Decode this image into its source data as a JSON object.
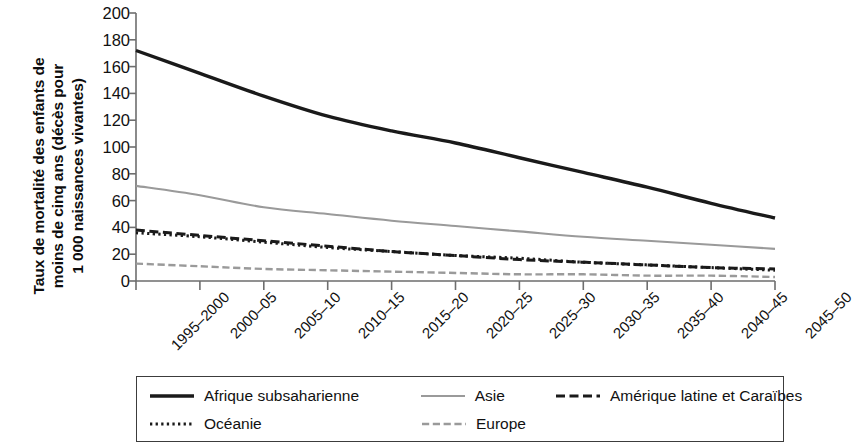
{
  "chart_data": {
    "type": "line",
    "title": "",
    "subtitle": "",
    "xlabel": "",
    "ylabel": "Taux de mortalité des enfants de\nmoins de cinq ans (décès pour\n1 000 naissances vivantes)",
    "ylim": [
      0,
      200
    ],
    "ytick_step": 20,
    "yticks": [
      200,
      180,
      160,
      140,
      120,
      100,
      80,
      60,
      40,
      20,
      0
    ],
    "grid": false,
    "legend_position": "bottom",
    "categories": [
      "1995–2000",
      "2000–05",
      "2005–10",
      "2010–15",
      "2015–20",
      "2020–25",
      "2025–30",
      "2030–35",
      "2035–40",
      "2040–45",
      "2045–50"
    ],
    "series": [
      {
        "name": "Afrique subsaharienne",
        "style": "solid",
        "color": "#1a1a1a",
        "width": 3.4,
        "values": [
          172,
          155,
          138,
          123,
          112,
          103,
          92,
          81,
          70,
          58,
          47
        ]
      },
      {
        "name": "Asie",
        "style": "solid",
        "color": "#9a9a9a",
        "width": 2.1,
        "values": [
          71,
          64,
          55,
          50,
          45,
          41,
          37,
          33,
          30,
          27,
          24
        ]
      },
      {
        "name": "Amérique latine et Caraïbes",
        "style": "dashed",
        "color": "#1a1a1a",
        "width": 3.0,
        "values": [
          38,
          34,
          30,
          26,
          22,
          19,
          16,
          14,
          12,
          10,
          9
        ]
      },
      {
        "name": "Océanie",
        "style": "dotted",
        "color": "#1a1a1a",
        "width": 3.0,
        "values": [
          36,
          33,
          29,
          25,
          22,
          19,
          17,
          14,
          12,
          10,
          8
        ]
      },
      {
        "name": "Europe",
        "style": "dashed",
        "color": "#9a9a9a",
        "width": 2.4,
        "values": [
          13,
          11,
          9,
          8,
          7,
          6,
          5,
          5,
          4,
          4,
          3
        ]
      }
    ]
  },
  "legend": {
    "rows": [
      [
        {
          "label": "Afrique subsaharienne",
          "style": "solid",
          "color": "#1a1a1a",
          "width": 3.4
        },
        {
          "label": "Asie",
          "style": "solid",
          "color": "#9a9a9a",
          "width": 2.1
        },
        {
          "label": "Amérique latine et Caraïbes",
          "style": "dashed",
          "color": "#1a1a1a",
          "width": 3.0
        }
      ],
      [
        {
          "label": "Océanie",
          "style": "dotted",
          "color": "#1a1a1a",
          "width": 3.0
        },
        {
          "label": "Europe",
          "style": "dashed",
          "color": "#9a9a9a",
          "width": 2.4
        }
      ]
    ]
  },
  "colors": {
    "axis": "#6e6e6e",
    "text": "#111111",
    "legend_border": "#3c3c3c",
    "background": "#ffffff"
  }
}
